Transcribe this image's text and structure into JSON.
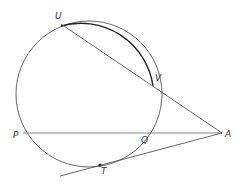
{
  "diagram": {
    "type": "circle-secants-tangent",
    "colors": {
      "stroke": "#555555",
      "bold_arc": "#222222",
      "label": "#333333",
      "background": "#ffffff"
    },
    "circle": {
      "cx": 89,
      "cy": 94,
      "r": 73
    },
    "points": {
      "U": {
        "label": "U",
        "x": 61,
        "y": 24
      },
      "V": {
        "label": "V",
        "x": 153,
        "y": 86
      },
      "P": {
        "label": "P",
        "x": 23,
        "y": 133
      },
      "Q": {
        "label": "Q",
        "x": 143,
        "y": 133
      },
      "T": {
        "label": "T",
        "x": 100,
        "y": 165
      },
      "A": {
        "label": "A",
        "x": 222,
        "y": 133
      }
    },
    "segments": [
      {
        "name": "secant-UA",
        "from": "U",
        "to": "A"
      },
      {
        "name": "secant-PA",
        "from": "P",
        "to": "A"
      },
      {
        "name": "tangent-TA",
        "from": "tangent-start",
        "to": "A"
      }
    ]
  }
}
